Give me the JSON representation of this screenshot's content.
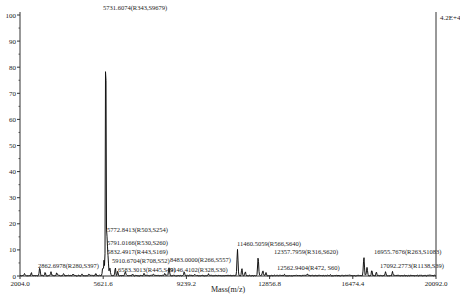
{
  "chart_data": {
    "type": "line",
    "title": "",
    "xlabel": "Mass(m/z)",
    "ylabel": "",
    "xlim": [
      2004.0,
      20092.0
    ],
    "ylim": [
      0,
      100
    ],
    "x_ticks": [
      "2004.0",
      "5621.6",
      "9239.2",
      "12856.8",
      "16474.4",
      "20092.0"
    ],
    "y_ticks": [
      "0",
      "10",
      "20",
      "30",
      "40",
      "50",
      "60",
      "70",
      "80",
      "90",
      "100"
    ],
    "max_intensity_label": "4.2E+4",
    "grid": false,
    "legend": null,
    "peaks": [
      {
        "mz": 2862.6978,
        "intensity": 3,
        "label": "2862.6978(R280,S397)"
      },
      {
        "mz": 5731.6074,
        "intensity": 100,
        "label": "5731.6074(R343,S9679)"
      },
      {
        "mz": 5772.8413,
        "intensity": 9,
        "label": "5772.8413(R503,S254)"
      },
      {
        "mz": 5791.0166,
        "intensity": 7,
        "label": "5791.0166(R530,S260)"
      },
      {
        "mz": 5832.4917,
        "intensity": 6,
        "label": "5832.4917(R443,S169)"
      },
      {
        "mz": 5910.6704,
        "intensity": 3,
        "label": "5910.6704(R708,S52)"
      },
      {
        "mz": 6583.3013,
        "intensity": 1.5,
        "label": "6583.3013(R445,S49)"
      },
      {
        "mz": 8483.0,
        "intensity": 3,
        "label": "8483.0000(R266,S557)"
      },
      {
        "mz": 9146.4102,
        "intensity": 1.5,
        "label": "9146.4102(R328,S30)"
      },
      {
        "mz": 11460.5059,
        "intensity": 10,
        "label": "11460.5059(R566,S640)"
      },
      {
        "mz": 12357.7959,
        "intensity": 7,
        "label": "12357.7959(R316,S620)"
      },
      {
        "mz": 12562.9404,
        "intensity": 2,
        "label": "12562.9404(R472, S60)"
      },
      {
        "mz": 16955.7676,
        "intensity": 7,
        "label": "16955.7676(R263,S1083)"
      },
      {
        "mz": 17092.2773,
        "intensity": 3,
        "label": "17092.2773(R1138,S39)"
      }
    ],
    "noise_peaks": [
      {
        "mz": 2200,
        "intensity": 0.8
      },
      {
        "mz": 2500,
        "intensity": 1.0
      },
      {
        "mz": 3100,
        "intensity": 1.2
      },
      {
        "mz": 3350,
        "intensity": 1.5
      },
      {
        "mz": 3600,
        "intensity": 1.0
      },
      {
        "mz": 3900,
        "intensity": 0.7
      },
      {
        "mz": 4300,
        "intensity": 0.6
      },
      {
        "mz": 4700,
        "intensity": 0.8
      },
      {
        "mz": 5000,
        "intensity": 0.8
      },
      {
        "mz": 5300,
        "intensity": 1.0
      },
      {
        "mz": 5600,
        "intensity": 3.0
      },
      {
        "mz": 5660,
        "intensity": 6.0
      },
      {
        "mz": 6150,
        "intensity": 3.0
      },
      {
        "mz": 6250,
        "intensity": 1.5
      },
      {
        "mz": 6900,
        "intensity": 0.7
      },
      {
        "mz": 7400,
        "intensity": 0.8
      },
      {
        "mz": 7800,
        "intensity": 0.7
      },
      {
        "mz": 8300,
        "intensity": 1.0
      },
      {
        "mz": 9600,
        "intensity": 0.5
      },
      {
        "mz": 10200,
        "intensity": 0.6
      },
      {
        "mz": 11650,
        "intensity": 3.0
      },
      {
        "mz": 11800,
        "intensity": 1.5
      },
      {
        "mz": 12700,
        "intensity": 1.0
      },
      {
        "mz": 13500,
        "intensity": 0.5
      },
      {
        "mz": 14500,
        "intensity": 0.5
      },
      {
        "mz": 15500,
        "intensity": 0.5
      },
      {
        "mz": 17300,
        "intensity": 2.0
      },
      {
        "mz": 17500,
        "intensity": 1.5
      },
      {
        "mz": 17900,
        "intensity": 1.5
      },
      {
        "mz": 18200,
        "intensity": 1.5
      }
    ]
  },
  "colors": {
    "axis": "#333333",
    "trace": "#111111",
    "text": "#222222",
    "background": "#ffffff"
  }
}
